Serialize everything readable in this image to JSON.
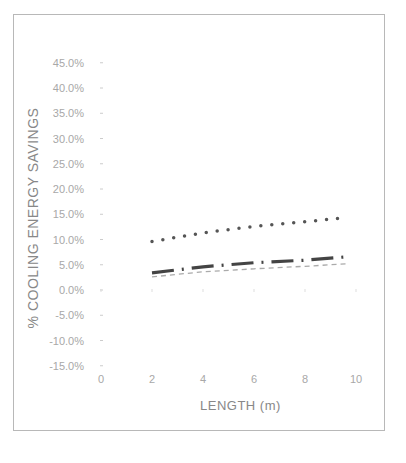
{
  "chart_data": {
    "type": "line",
    "title": "",
    "xlabel": "LENGTH (m)",
    "ylabel": "% COOLING ENERGY SAVINGS",
    "xlim": [
      0,
      10
    ],
    "ylim": [
      -15,
      45
    ],
    "x_ticks": [
      "0",
      "2",
      "4",
      "6",
      "8",
      "10"
    ],
    "y_ticks": [
      "45.0%",
      "40.0%",
      "35.0%",
      "30.0%",
      "25.0%",
      "20.0%",
      "15.0%",
      "10.0%",
      "5.0%",
      "0.0%",
      "-5.0%",
      "-10.0%",
      "-15.0%"
    ],
    "grid": false,
    "legend": null,
    "x": [
      2,
      4,
      6,
      8,
      10
    ],
    "series": [
      {
        "name": "dotted",
        "style": "dotted",
        "values": [
          9.6,
          11.3,
          12.6,
          13.5,
          14.4
        ]
      },
      {
        "name": "dash-dot",
        "style": "dash-dot",
        "values": [
          3.4,
          4.6,
          5.4,
          5.9,
          6.6
        ]
      },
      {
        "name": "dashed",
        "style": "dashed",
        "values": [
          2.6,
          3.6,
          4.2,
          4.7,
          5.2
        ]
      }
    ]
  }
}
